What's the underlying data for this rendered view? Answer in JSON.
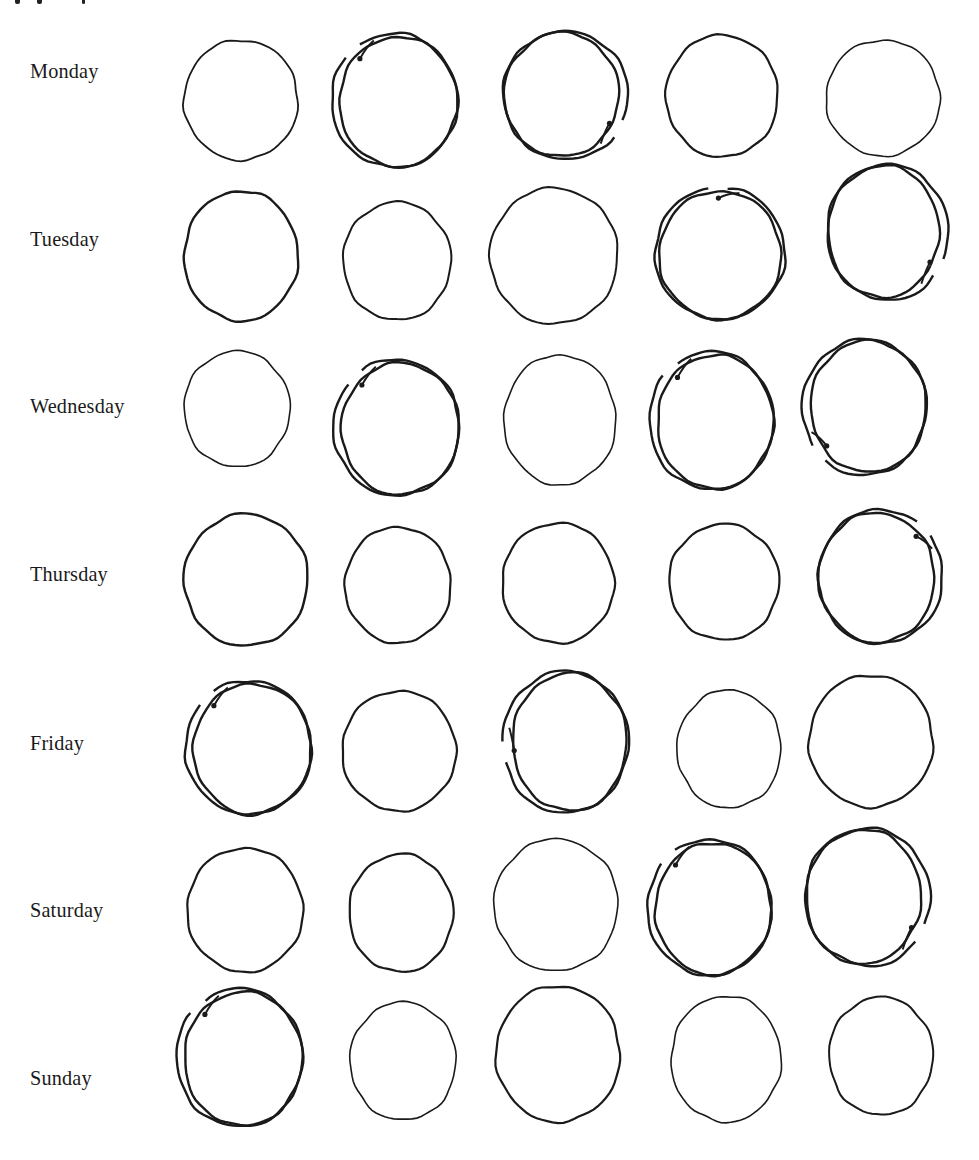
{
  "page": {
    "width": 979,
    "height": 1160,
    "background": "#ffffff",
    "ink_color": "#1a1a1a"
  },
  "rows": [
    {
      "label": "Monday",
      "label_y": 72,
      "circles": [
        {
          "cx": 241,
          "cy": 100,
          "rx": 57,
          "ry": 60,
          "type": "single",
          "weight": 1.8
        },
        {
          "cx": 396,
          "cy": 101,
          "rx": 63,
          "ry": 66,
          "type": "double",
          "weight": 2.4,
          "dot": "top-left"
        },
        {
          "cx": 564,
          "cy": 95,
          "rx": 62,
          "ry": 63,
          "type": "double",
          "weight": 2.4,
          "dot": "bottom-right"
        },
        {
          "cx": 722,
          "cy": 96,
          "rx": 56,
          "ry": 61,
          "type": "single",
          "weight": 2.2
        },
        {
          "cx": 883,
          "cy": 98,
          "rx": 57,
          "ry": 58,
          "type": "single",
          "weight": 1.6
        }
      ]
    },
    {
      "label": "Tuesday",
      "label_y": 240,
      "circles": [
        {
          "cx": 241,
          "cy": 256,
          "rx": 57,
          "ry": 65,
          "type": "single",
          "weight": 2.4
        },
        {
          "cx": 397,
          "cy": 261,
          "rx": 54,
          "ry": 59,
          "type": "single",
          "weight": 2.0
        },
        {
          "cx": 554,
          "cy": 256,
          "rx": 64,
          "ry": 68,
          "type": "single",
          "weight": 2.0
        },
        {
          "cx": 720,
          "cy": 254,
          "rx": 65,
          "ry": 65,
          "type": "double",
          "weight": 2.4,
          "dot": "top"
        },
        {
          "cx": 886,
          "cy": 232,
          "rx": 60,
          "ry": 67,
          "type": "double",
          "weight": 2.4,
          "dot": "bottom-right"
        }
      ]
    },
    {
      "label": "Wednesday",
      "label_y": 407,
      "circles": [
        {
          "cx": 237,
          "cy": 409,
          "rx": 53,
          "ry": 58,
          "type": "single",
          "weight": 1.6
        },
        {
          "cx": 398,
          "cy": 428,
          "rx": 63,
          "ry": 67,
          "type": "double",
          "weight": 2.4,
          "dot": "top-left"
        },
        {
          "cx": 560,
          "cy": 420,
          "rx": 56,
          "ry": 65,
          "type": "single",
          "weight": 1.6
        },
        {
          "cx": 713,
          "cy": 421,
          "rx": 62,
          "ry": 68,
          "type": "double",
          "weight": 2.4,
          "dot": "top-left"
        },
        {
          "cx": 866,
          "cy": 407,
          "rx": 62,
          "ry": 67,
          "type": "double",
          "weight": 2.4,
          "dot": "bottom-left"
        }
      ]
    },
    {
      "label": "Thursday",
      "label_y": 575,
      "circles": [
        {
          "cx": 246,
          "cy": 580,
          "rx": 62,
          "ry": 66,
          "type": "single",
          "weight": 2.4
        },
        {
          "cx": 398,
          "cy": 585,
          "rx": 53,
          "ry": 58,
          "type": "single",
          "weight": 2.2
        },
        {
          "cx": 558,
          "cy": 583,
          "rx": 56,
          "ry": 60,
          "type": "single",
          "weight": 2.2
        },
        {
          "cx": 724,
          "cy": 582,
          "rx": 55,
          "ry": 58,
          "type": "single",
          "weight": 2.2
        },
        {
          "cx": 879,
          "cy": 577,
          "rx": 62,
          "ry": 66,
          "type": "double",
          "weight": 2.4,
          "dot": "top-right"
        }
      ]
    },
    {
      "label": "Friday",
      "label_y": 744,
      "circles": [
        {
          "cx": 250,
          "cy": 748,
          "rx": 63,
          "ry": 66,
          "type": "double",
          "weight": 2.4,
          "dot": "top-left"
        },
        {
          "cx": 399,
          "cy": 751,
          "rx": 57,
          "ry": 60,
          "type": "single",
          "weight": 2.2
        },
        {
          "cx": 567,
          "cy": 742,
          "rx": 62,
          "ry": 70,
          "type": "double",
          "weight": 2.4,
          "dot": "left"
        },
        {
          "cx": 729,
          "cy": 749,
          "rx": 52,
          "ry": 59,
          "type": "single",
          "weight": 1.6
        },
        {
          "cx": 871,
          "cy": 741,
          "rx": 62,
          "ry": 66,
          "type": "single",
          "weight": 2.2
        }
      ]
    },
    {
      "label": "Saturday",
      "label_y": 911,
      "circles": [
        {
          "cx": 245,
          "cy": 910,
          "rx": 58,
          "ry": 62,
          "type": "single",
          "weight": 2.2
        },
        {
          "cx": 401,
          "cy": 913,
          "rx": 52,
          "ry": 59,
          "type": "single",
          "weight": 2.2
        },
        {
          "cx": 556,
          "cy": 905,
          "rx": 62,
          "ry": 66,
          "type": "single",
          "weight": 1.6
        },
        {
          "cx": 711,
          "cy": 908,
          "rx": 62,
          "ry": 67,
          "type": "double",
          "weight": 2.4,
          "dot": "top-left"
        },
        {
          "cx": 866,
          "cy": 897,
          "rx": 62,
          "ry": 68,
          "type": "double",
          "weight": 2.4,
          "dot": "bottom-right"
        }
      ]
    },
    {
      "label": "Sunday",
      "label_y": 1079,
      "circles": [
        {
          "cx": 241,
          "cy": 1058,
          "rx": 63,
          "ry": 68,
          "type": "double",
          "weight": 2.4,
          "dot": "top-left"
        },
        {
          "cx": 403,
          "cy": 1061,
          "rx": 53,
          "ry": 59,
          "type": "single",
          "weight": 1.6
        },
        {
          "cx": 558,
          "cy": 1054,
          "rx": 62,
          "ry": 68,
          "type": "single",
          "weight": 2.2
        },
        {
          "cx": 726,
          "cy": 1059,
          "rx": 55,
          "ry": 63,
          "type": "single",
          "weight": 1.6
        },
        {
          "cx": 881,
          "cy": 1056,
          "rx": 52,
          "ry": 59,
          "type": "single",
          "weight": 2.0
        }
      ]
    }
  ]
}
